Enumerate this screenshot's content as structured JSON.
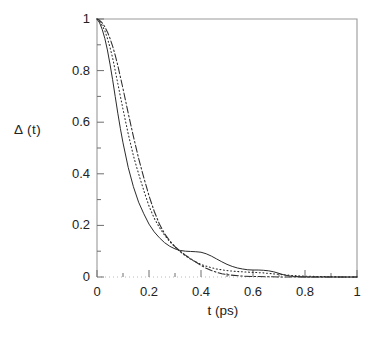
{
  "chart_data": {
    "type": "line",
    "title": "",
    "xlabel": "t (ps)",
    "ylabel": "Δ (t)",
    "xlim": [
      0,
      1
    ],
    "ylim": [
      0,
      1
    ],
    "grid": false,
    "legend": "none",
    "x_ticks": [
      "0",
      "0.2",
      "0.4",
      "0.6",
      "0.8",
      "1"
    ],
    "x_tick_values": [
      0,
      0.2,
      0.4,
      0.6,
      0.8,
      1
    ],
    "x_minor_step": 0.1,
    "y_ticks": [
      "0",
      "0.2",
      "0.4",
      "0.6",
      "0.8",
      "1"
    ],
    "y_tick_values": [
      0,
      0.2,
      0.4,
      0.6,
      0.8,
      1
    ],
    "y_minor_step": 0.1,
    "series": [
      {
        "name": "solid",
        "style": "solid",
        "color": "#2b2b2b",
        "x": [
          0,
          0.01,
          0.02,
          0.03,
          0.04,
          0.05,
          0.06,
          0.07,
          0.08,
          0.09,
          0.1,
          0.12,
          0.14,
          0.16,
          0.18,
          0.2,
          0.22,
          0.24,
          0.26,
          0.28,
          0.3,
          0.32,
          0.34,
          0.36,
          0.38,
          0.4,
          0.42,
          0.44,
          0.46,
          0.48,
          0.5,
          0.52,
          0.54,
          0.56,
          0.58,
          0.6,
          0.62,
          0.64,
          0.66,
          0.68,
          0.7,
          0.72,
          0.74,
          0.76,
          0.8,
          0.85,
          0.9,
          0.95,
          1.0
        ],
        "y": [
          1.0,
          0.985,
          0.96,
          0.925,
          0.88,
          0.825,
          0.765,
          0.7,
          0.635,
          0.575,
          0.52,
          0.425,
          0.35,
          0.29,
          0.245,
          0.205,
          0.175,
          0.152,
          0.133,
          0.119,
          0.109,
          0.103,
          0.1,
          0.099,
          0.098,
          0.096,
          0.09,
          0.081,
          0.07,
          0.059,
          0.049,
          0.041,
          0.035,
          0.031,
          0.028,
          0.027,
          0.027,
          0.026,
          0.024,
          0.02,
          0.014,
          0.008,
          0.004,
          0.002,
          0.0,
          0.0,
          0.0,
          0.0,
          0.0
        ]
      },
      {
        "name": "dotted",
        "style": "dotted",
        "color": "#2b2b2b",
        "x": [
          0,
          0.01,
          0.02,
          0.03,
          0.04,
          0.05,
          0.06,
          0.07,
          0.08,
          0.09,
          0.1,
          0.12,
          0.14,
          0.16,
          0.18,
          0.2,
          0.22,
          0.24,
          0.26,
          0.28,
          0.3,
          0.32,
          0.34,
          0.36,
          0.38,
          0.4,
          0.42,
          0.44,
          0.46,
          0.48,
          0.5,
          0.52,
          0.54,
          0.56,
          0.58,
          0.6,
          0.62,
          0.64,
          0.66,
          0.7,
          0.75,
          0.8,
          0.85,
          0.9,
          0.95,
          1.0
        ],
        "y": [
          1.0,
          0.99,
          0.975,
          0.955,
          0.925,
          0.89,
          0.85,
          0.8,
          0.75,
          0.7,
          0.65,
          0.555,
          0.47,
          0.4,
          0.335,
          0.275,
          0.228,
          0.192,
          0.162,
          0.137,
          0.116,
          0.098,
          0.082,
          0.069,
          0.058,
          0.049,
          0.042,
          0.036,
          0.031,
          0.028,
          0.025,
          0.023,
          0.021,
          0.02,
          0.019,
          0.018,
          0.017,
          0.016,
          0.014,
          0.01,
          0.006,
          0.003,
          0.002,
          0.001,
          0.0,
          0.0
        ]
      },
      {
        "name": "dash-dot",
        "style": "dashdot",
        "color": "#2b2b2b",
        "x": [
          0,
          0.01,
          0.02,
          0.03,
          0.04,
          0.05,
          0.06,
          0.07,
          0.08,
          0.09,
          0.1,
          0.12,
          0.14,
          0.16,
          0.18,
          0.2,
          0.22,
          0.24,
          0.26,
          0.28,
          0.3,
          0.32,
          0.34,
          0.36,
          0.38,
          0.4,
          0.42,
          0.44,
          0.46,
          0.48,
          0.5,
          0.55,
          0.6,
          0.65,
          0.7,
          0.8,
          0.9,
          1.0
        ],
        "y": [
          1.0,
          0.995,
          0.985,
          0.97,
          0.95,
          0.925,
          0.895,
          0.86,
          0.82,
          0.775,
          0.73,
          0.635,
          0.545,
          0.46,
          0.385,
          0.315,
          0.255,
          0.205,
          0.168,
          0.14,
          0.118,
          0.1,
          0.085,
          0.071,
          0.058,
          0.045,
          0.034,
          0.025,
          0.018,
          0.013,
          0.009,
          0.004,
          0.002,
          0.001,
          0.0,
          0.0,
          0.0,
          0.0
        ]
      }
    ]
  },
  "axes": {
    "frame_color": "#9a9a9a",
    "tick_color": "#6e6e6e"
  }
}
